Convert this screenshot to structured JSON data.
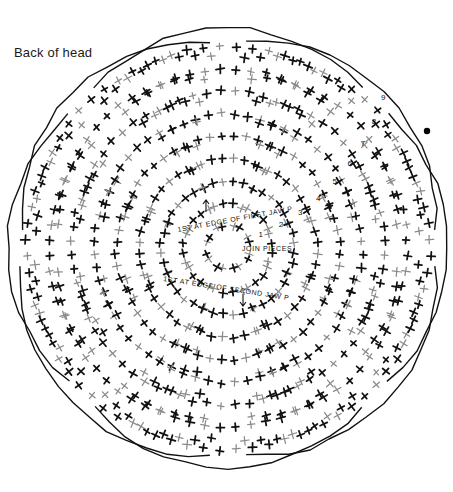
{
  "page": {
    "background_color": "#ffffff",
    "width": 453,
    "height": 492
  },
  "caption": {
    "text": "Back of head",
    "color": "#1a1a1a"
  },
  "diagram": {
    "title": "Back of head",
    "kind": "radial cross-stitch / braid layout chart",
    "stitch_color_dark": "#111111",
    "stitch_color_gray": "#8a8a8a",
    "labels": [
      {
        "id": "first-jaw-piece",
        "text": "1ST AT EDGE OF FIRST JAW PIECE"
      },
      {
        "id": "join-pieces",
        "text": "JOIN PIECES"
      },
      {
        "id": "second-jaw-piece",
        "text": "1ST AT EDGE OF SECOND JAW PIECE"
      }
    ],
    "numbers": [
      "1",
      "2",
      "3",
      "4",
      "5",
      "6",
      "7",
      "8",
      "9"
    ],
    "dot": {
      "id": "start-dot",
      "color": "#000000"
    }
  },
  "chart_data": {
    "type": "scatter",
    "title": "Back of head",
    "xlabel": "",
    "ylabel": "",
    "petals": 8,
    "rows": 9,
    "center": [
      228,
      248
    ],
    "legend": [],
    "grid": false
  }
}
